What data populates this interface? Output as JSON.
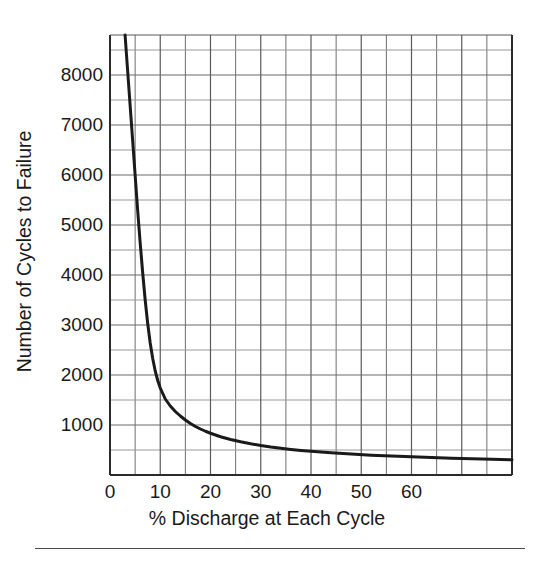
{
  "figure": {
    "bottom_rule": "horizontal-divider-rule"
  },
  "chart_data": {
    "type": "line",
    "title": "",
    "subtitle": "",
    "xlabel": "% Discharge at Each Cycle",
    "ylabel": "Number of Cycles to Failure",
    "xlim": [
      0,
      80
    ],
    "ylim": [
      0,
      8800
    ],
    "xticks": [
      0,
      10,
      20,
      30,
      40,
      50,
      60
    ],
    "xticklabels": [
      "0",
      "10",
      "20",
      "30",
      "40",
      "50",
      "60"
    ],
    "yticks": [
      1000,
      2000,
      3000,
      4000,
      5000,
      6000,
      7000,
      8000
    ],
    "yticklabels": [
      "1000",
      "2000",
      "3000",
      "4000",
      "5000",
      "6000",
      "7000",
      "8000"
    ],
    "grid": true,
    "grid_major_x_step": 10,
    "grid_minor_x_step": 5,
    "grid_major_y_step": 1000,
    "grid_minor_y_step": 500,
    "legend": "none",
    "series": [
      {
        "name": "Cycles to Failure vs % Discharge",
        "color": "#1a1a1a",
        "linewidth": 3,
        "x": [
          3,
          3.5,
          4,
          4.5,
          5,
          5.5,
          6,
          6.5,
          7,
          7.5,
          8,
          8.5,
          9,
          9.5,
          10,
          11,
          12,
          13,
          14,
          15,
          16,
          17,
          18,
          19,
          20,
          22,
          24,
          26,
          28,
          30,
          32,
          34,
          36,
          38,
          40,
          44,
          48,
          52,
          56,
          60,
          64,
          68,
          72,
          76,
          80
        ],
        "y": [
          8800,
          8100,
          7400,
          6700,
          6000,
          5300,
          4650,
          4050,
          3500,
          3030,
          2640,
          2330,
          2080,
          1890,
          1740,
          1520,
          1380,
          1270,
          1180,
          1100,
          1030,
          970,
          920,
          875,
          835,
          765,
          710,
          665,
          625,
          590,
          560,
          535,
          512,
          492,
          475,
          443,
          418,
          397,
          380,
          364,
          350,
          337,
          325,
          314,
          305
        ]
      }
    ]
  },
  "axes": {
    "plot_left_px": 110,
    "plot_right_px": 512,
    "plot_top_px": 35,
    "plot_bottom_px": 475
  }
}
